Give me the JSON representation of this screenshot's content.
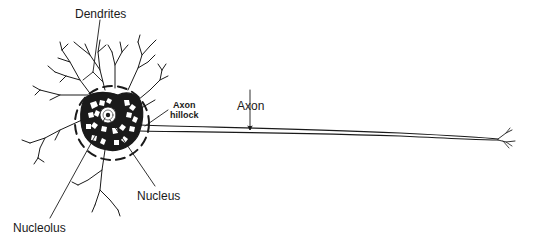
{
  "diagram": {
    "labels": {
      "dendrites": "Dendrites",
      "axon_hillock_line1": "Axon",
      "axon_hillock_line2": "hillock",
      "axon": "Axon",
      "nucleus": "Nucleus",
      "nucleolus": "Nucleolus"
    },
    "colors": {
      "ink": "#1a1a1a",
      "background": "#ffffff"
    }
  }
}
